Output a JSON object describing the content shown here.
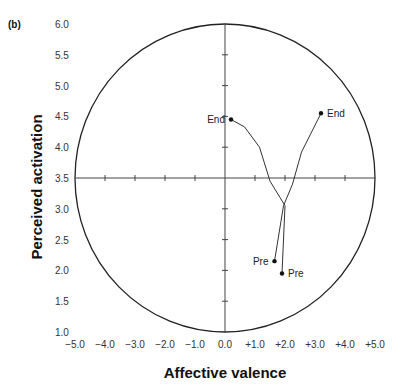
{
  "panel_label": "(b)",
  "chart_data": {
    "type": "line",
    "title": "",
    "xlabel": "Affective valence",
    "ylabel": "Perceived activation",
    "xlim": [
      -5.0,
      5.0
    ],
    "ylim": [
      1.0,
      6.0
    ],
    "x_ticks": [
      "−5.0",
      "−4.0",
      "−3.0",
      "−2.0",
      "−1.0",
      "0.0",
      "+1.0",
      "+2.0",
      "+3.0",
      "+4.0",
      "+5.0"
    ],
    "y_ticks": [
      "1.0",
      "1.5",
      "2.0",
      "2.5",
      "3.0",
      "3.5",
      "4.0",
      "4.5",
      "5.0",
      "5.5",
      "6.0"
    ],
    "grid": false,
    "circumplex": {
      "center": [
        0.0,
        3.5
      ],
      "x_radius": 5.0,
      "y_radius": 2.5
    },
    "series": [
      {
        "name": "Trajectory A",
        "points": [
          {
            "x": 1.9,
            "y": 1.95,
            "label": "Pre"
          },
          {
            "x": 2.0,
            "y": 3.05
          },
          {
            "x": 1.5,
            "y": 3.45
          },
          {
            "x": 1.15,
            "y": 4.0
          },
          {
            "x": 0.65,
            "y": 4.33
          },
          {
            "x": 0.2,
            "y": 4.45,
            "label": "End"
          }
        ]
      },
      {
        "name": "Trajectory B",
        "points": [
          {
            "x": 1.65,
            "y": 2.15,
            "label": "Pre"
          },
          {
            "x": 1.95,
            "y": 3.05
          },
          {
            "x": 2.25,
            "y": 3.4
          },
          {
            "x": 2.55,
            "y": 3.92
          },
          {
            "x": 3.2,
            "y": 4.55,
            "label": "End"
          }
        ]
      }
    ]
  }
}
